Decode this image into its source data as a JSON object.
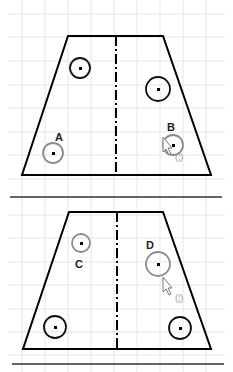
{
  "diagram": {
    "type": "engineering-sketch",
    "colors": {
      "edge": "#000000",
      "grid": "#e6e6e6",
      "hole_selected": "#8c8c8c",
      "hole_normal": "#111111"
    },
    "top_view": {
      "labels": {
        "a": "A",
        "b": "B"
      },
      "snap_indicator": "(¦)",
      "holes": [
        {
          "name": "upper-left",
          "state": "normal"
        },
        {
          "name": "upper-right",
          "state": "normal"
        },
        {
          "name": "A",
          "state": "highlighted"
        },
        {
          "name": "B",
          "state": "highlighted"
        }
      ]
    },
    "bottom_view": {
      "labels": {
        "c": "C",
        "d": "D"
      },
      "snap_indicator": "(¦)",
      "holes": [
        {
          "name": "C",
          "state": "highlighted"
        },
        {
          "name": "D",
          "state": "highlighted"
        },
        {
          "name": "lower-left",
          "state": "normal"
        },
        {
          "name": "lower-right",
          "state": "normal"
        }
      ]
    }
  }
}
